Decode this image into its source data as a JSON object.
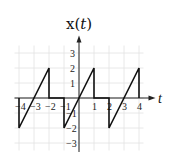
{
  "chart_data": {
    "type": "line",
    "title": "x(t)",
    "xlabel": "t",
    "ylabel": "x(t)",
    "xlim": [
      -4,
      4
    ],
    "ylim": [
      -3,
      3
    ],
    "grid": true,
    "x_ticks": [
      -4,
      -3,
      -2,
      -1,
      1,
      2,
      3,
      4
    ],
    "y_ticks": [
      -3,
      -2,
      -1,
      1,
      2,
      3
    ],
    "x_tick_labels": [
      "-4",
      "-3",
      "-2",
      "-1",
      "1",
      "2",
      "3",
      "4"
    ],
    "y_tick_labels": [
      "-3",
      "-2",
      "-1",
      "1",
      "2",
      "3"
    ],
    "series": [
      {
        "name": "x(t)",
        "points": [
          [
            -4,
            0
          ],
          [
            -4,
            -2
          ],
          [
            -2,
            2
          ],
          [
            -2,
            0
          ],
          [
            -1,
            0
          ],
          [
            -1,
            -2
          ],
          [
            1,
            2
          ],
          [
            1,
            0
          ],
          [
            2,
            0
          ],
          [
            2,
            -2
          ],
          [
            4,
            2
          ],
          [
            4,
            0
          ]
        ]
      }
    ]
  },
  "labels": {
    "title_main": "x(",
    "title_var": "t",
    "title_close": ")",
    "t_axis": "t"
  }
}
